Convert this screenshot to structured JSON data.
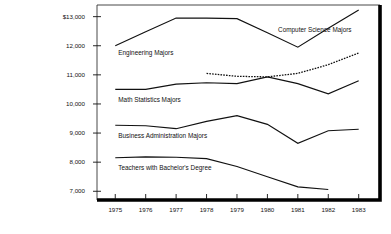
{
  "chart_data": {
    "type": "line",
    "title": "",
    "subtitle": "",
    "xlabel": "",
    "ylabel": "",
    "x": [
      1975,
      1976,
      1977,
      1978,
      1979,
      1980,
      1981,
      1982,
      1983
    ],
    "xtick_labels": [
      "1975",
      "1976",
      "1977",
      "1978",
      "1979",
      "1980",
      "1981",
      "1982",
      "1983"
    ],
    "ytick_labels": [
      "$13,000",
      "12,000",
      "11,000",
      "10,000",
      "9,000",
      "8,000",
      "7,000"
    ],
    "ytick_values": [
      13000,
      12000,
      11000,
      10000,
      9000,
      8000,
      7000
    ],
    "xlim": [
      1974.4,
      1983.7
    ],
    "ylim": [
      6700,
      13400
    ],
    "grid": false,
    "legend": "inline-labels",
    "series": [
      {
        "name": "Engineering Majors",
        "label": "Engineering Majors",
        "style": "solid",
        "x": [
          1975,
          1976,
          1977,
          1978,
          1979,
          1980,
          1981,
          1982,
          1983
        ],
        "values": [
          12000,
          12480,
          12950,
          12950,
          12930,
          12450,
          11950,
          12600,
          13230
        ]
      },
      {
        "name": "Computer Science Majors",
        "label": "Computer Science Majors",
        "style": "dashed",
        "x": [
          1978,
          1979,
          1980,
          1981,
          1982,
          1983
        ],
        "values": [
          11050,
          10950,
          10930,
          11050,
          11350,
          11750
        ]
      },
      {
        "name": "Math Statistics Majors",
        "label": "Math Statistics Majors",
        "style": "solid",
        "x": [
          1975,
          1976,
          1977,
          1978,
          1979,
          1980,
          1981,
          1982,
          1983
        ],
        "values": [
          10500,
          10500,
          10680,
          10730,
          10700,
          10930,
          10700,
          10350,
          10800
        ]
      },
      {
        "name": "Business Administration Majors",
        "label": "Business Administration Majors",
        "style": "solid",
        "x": [
          1975,
          1976,
          1977,
          1978,
          1979,
          1980,
          1981,
          1982,
          1983
        ],
        "values": [
          9270,
          9250,
          9150,
          9400,
          9600,
          9300,
          8650,
          9080,
          9130
        ]
      },
      {
        "name": "Teachers with Bachelor's Degree",
        "label": "Teachers with Bachelor's Degree",
        "style": "solid",
        "x": [
          1975,
          1976,
          1977,
          1978,
          1979,
          1980,
          1981,
          1982
        ],
        "values": [
          8150,
          8180,
          8170,
          8120,
          7850,
          7500,
          7150,
          7060
        ]
      }
    ],
    "inline_labels": [
      {
        "text": "Engineering Majors",
        "x": 1975.1,
        "y": 11680,
        "anchor": "start"
      },
      {
        "text": "Computer Science Majors",
        "x": 1980.35,
        "y": 12480,
        "anchor": "start"
      },
      {
        "text": "Math Statistics Majors",
        "x": 1975.1,
        "y": 10080,
        "anchor": "start"
      },
      {
        "text": "Business Administration Majors",
        "x": 1975.1,
        "y": 8840,
        "anchor": "start"
      },
      {
        "text": "Teachers with Bachelor's Degree",
        "x": 1975.1,
        "y": 7720,
        "anchor": "start"
      }
    ]
  }
}
